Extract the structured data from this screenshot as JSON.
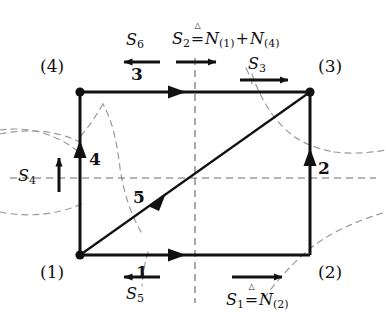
{
  "figure": {
    "background_color": "#ffffff",
    "line_color": "#111111",
    "dash_color": "#9a9a9a"
  },
  "nodes": [
    {
      "id": "n1",
      "label": "(1)",
      "x": 80,
      "y": 255,
      "dot": true
    },
    {
      "id": "n2",
      "label": "(2)",
      "x": 310,
      "y": 255,
      "dot": false
    },
    {
      "id": "n3",
      "label": "(3)",
      "x": 310,
      "y": 92,
      "dot": true
    },
    {
      "id": "n4",
      "label": "(4)",
      "x": 80,
      "y": 92,
      "dot": true
    }
  ],
  "edges": [
    {
      "id": "e1",
      "label": "1",
      "from": "n1",
      "to": "n2",
      "direction": "right",
      "position": "bottom"
    },
    {
      "id": "e2",
      "label": "2",
      "from": "n2",
      "to": "n3",
      "direction": "up",
      "position": "right"
    },
    {
      "id": "e3",
      "label": "3",
      "from": "n4",
      "to": "n3",
      "direction": "right",
      "position": "top"
    },
    {
      "id": "e4",
      "label": "4",
      "from": "n1",
      "to": "n4",
      "direction": "up",
      "position": "left"
    },
    {
      "id": "e5",
      "label": "5",
      "from": "n1",
      "to": "n3",
      "direction": "up-right",
      "position": "diagonal"
    }
  ],
  "cuts": [
    {
      "id": "S1",
      "name": "S1",
      "sub": "1",
      "arrow": "right",
      "has_definition": true,
      "definition_symbol": "N",
      "definition_sub": "(2)",
      "text": "S1 = N(2)"
    },
    {
      "id": "S2",
      "name": "S2",
      "sub": "2",
      "arrow": "right",
      "has_definition": true,
      "definition_symbol": "N",
      "definition_sub": "(1)",
      "definition_symbol2": "N",
      "definition_sub2": "(4)",
      "text": "S2 = N(1) + N(4)"
    },
    {
      "id": "S3",
      "name": "S3",
      "sub": "3",
      "arrow": "right",
      "has_definition": false,
      "text": "S3"
    },
    {
      "id": "S4",
      "name": "S4",
      "sub": "4",
      "arrow": "up",
      "has_definition": false,
      "text": "S4"
    },
    {
      "id": "S5",
      "name": "S5",
      "sub": "5",
      "arrow": "left",
      "has_definition": false,
      "text": "S5"
    },
    {
      "id": "S6",
      "name": "S6",
      "sub": "6",
      "arrow": "left",
      "has_definition": false,
      "text": "S6"
    }
  ],
  "labels": {
    "node_1": "(1)",
    "node_2": "(2)",
    "node_3": "(3)",
    "node_4": "(4)",
    "edge_1": "1",
    "edge_2": "2",
    "edge_3": "3",
    "edge_4": "4",
    "edge_5": "5",
    "S_letter": "S",
    "N_letter": "N",
    "plus": "+",
    "sub_1": "1",
    "sub_2": "2",
    "sub_3": "3",
    "sub_4": "4",
    "sub_5": "5",
    "sub_6": "6",
    "paren_1": "(1)",
    "paren_2": "(2)",
    "paren_4": "(4)",
    "triangle": "△"
  }
}
